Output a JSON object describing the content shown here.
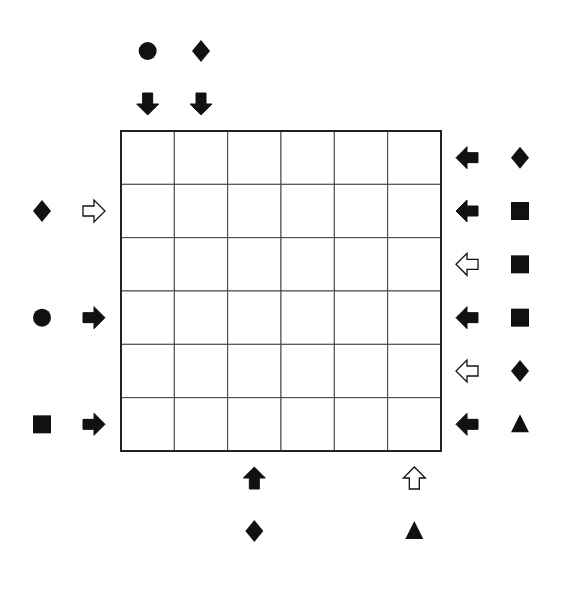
{
  "puzzle": {
    "rows": 6,
    "cols": 6,
    "colors": {
      "ink": "#111111",
      "grid": "#444444",
      "background": "#ffffff"
    },
    "clues": {
      "top": [
        {
          "col": 0,
          "symbol": "circle",
          "arrow": "down",
          "arrow_style": "filled"
        },
        {
          "col": 1,
          "symbol": "diamond",
          "arrow": "down",
          "arrow_style": "filled"
        }
      ],
      "right": [
        {
          "row": 0,
          "symbol": "diamond",
          "arrow": "left",
          "arrow_style": "filled"
        },
        {
          "row": 1,
          "symbol": "square",
          "arrow": "left",
          "arrow_style": "filled"
        },
        {
          "row": 2,
          "symbol": "square",
          "arrow": "left",
          "arrow_style": "outline"
        },
        {
          "row": 3,
          "symbol": "square",
          "arrow": "left",
          "arrow_style": "filled"
        },
        {
          "row": 4,
          "symbol": "diamond",
          "arrow": "left",
          "arrow_style": "outline"
        },
        {
          "row": 5,
          "symbol": "triangle",
          "arrow": "left",
          "arrow_style": "filled"
        }
      ],
      "left": [
        {
          "row": 1,
          "symbol": "diamond",
          "arrow": "right",
          "arrow_style": "outline"
        },
        {
          "row": 3,
          "symbol": "circle",
          "arrow": "right",
          "arrow_style": "filled"
        },
        {
          "row": 5,
          "symbol": "square",
          "arrow": "right",
          "arrow_style": "filled"
        }
      ],
      "bottom": [
        {
          "col": 2,
          "symbol": "diamond",
          "arrow": "up",
          "arrow_style": "filled"
        },
        {
          "col": 5,
          "symbol": "triangle",
          "arrow": "up",
          "arrow_style": "outline"
        }
      ]
    }
  }
}
